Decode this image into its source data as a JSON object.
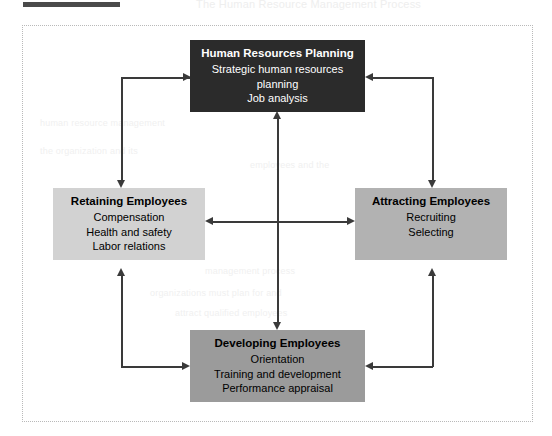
{
  "figure": {
    "frame_style": "dotted",
    "background": "#ffffff",
    "line_color": "#3a3a3a"
  },
  "page_artifacts": {
    "top_bar_color": "#4a4a4a",
    "bleed_text": {
      "title": "The Human Resource Management Process",
      "l1": "human resource management",
      "l2": "the organization and its",
      "l3": "employees and the",
      "l4": "management process",
      "l5": "organizations must plan for and",
      "l6": "attract qualified employees"
    }
  },
  "nodes": [
    {
      "id": "hrp",
      "title": "Human Resources Planning",
      "lines": [
        "Strategic human resources",
        "planning",
        "Job analysis"
      ],
      "fill": "#2b2b2b",
      "text_color": "#ffffff"
    },
    {
      "id": "retaining",
      "title": "Retaining Employees",
      "lines": [
        "Compensation",
        "Health and safety",
        "Labor relations"
      ],
      "fill": "#d2d2d2",
      "text_color": "#000000"
    },
    {
      "id": "attracting",
      "title": "Attracting Employees",
      "lines": [
        "Recruiting",
        "Selecting"
      ],
      "fill": "#b2b2b2",
      "text_color": "#000000"
    },
    {
      "id": "developing",
      "title": "Developing Employees",
      "lines": [
        "Orientation",
        "Training and development",
        "Performance appraisal"
      ],
      "fill": "#9b9b9b",
      "text_color": "#000000"
    }
  ],
  "connectors": [
    {
      "name": "hrp-to-retaining",
      "from": "hrp",
      "to": "retaining",
      "shape": "elbow-left",
      "heads": [
        "right-into-hrp",
        "down-into-retaining"
      ]
    },
    {
      "name": "hrp-to-attracting",
      "from": "hrp",
      "to": "attracting",
      "shape": "elbow-right",
      "heads": [
        "left-into-hrp",
        "down-into-attracting"
      ]
    },
    {
      "name": "developing-to-retaining",
      "from": "developing",
      "to": "retaining",
      "shape": "elbow-left-lower",
      "heads": [
        "right-into-developing",
        "up-into-retaining"
      ]
    },
    {
      "name": "developing-to-attracting",
      "from": "developing",
      "to": "attracting",
      "shape": "elbow-right-lower",
      "heads": [
        "left-into-developing",
        "up-into-attracting"
      ]
    },
    {
      "name": "retaining-attracting-horizontal",
      "shape": "double-arrow-horizontal",
      "heads": [
        "left",
        "right"
      ]
    },
    {
      "name": "hrp-developing-vertical",
      "shape": "double-arrow-vertical",
      "heads": [
        "up",
        "down"
      ]
    }
  ]
}
